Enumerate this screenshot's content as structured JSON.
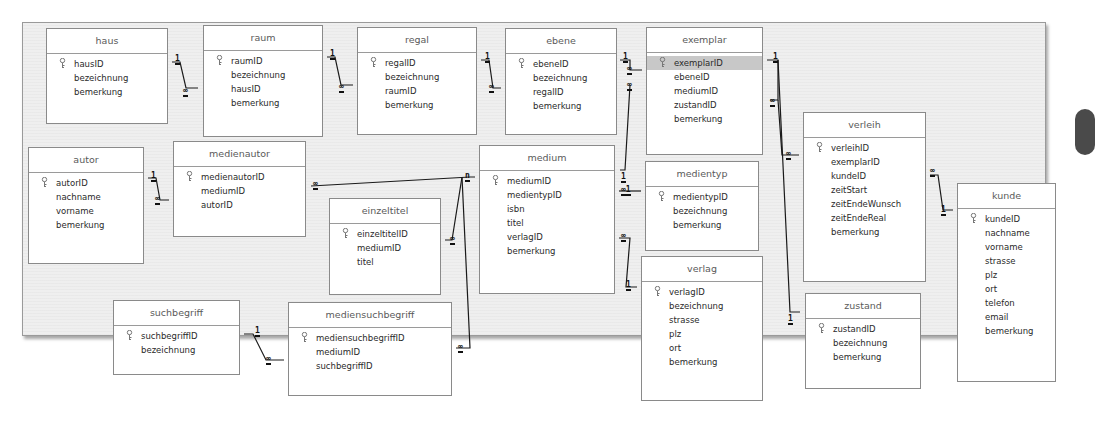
{
  "diagram": {
    "tables": [
      {
        "id": "haus",
        "name": "haus",
        "x": 46,
        "y": 28,
        "w": 122,
        "h": 96,
        "fields": [
          {
            "name": "hausID",
            "pk": true
          },
          {
            "name": "bezeichnung"
          },
          {
            "name": "bemerkung"
          }
        ]
      },
      {
        "id": "raum",
        "name": "raum",
        "x": 203,
        "y": 25,
        "w": 120,
        "h": 112,
        "fields": [
          {
            "name": "raumID",
            "pk": true
          },
          {
            "name": "bezeichnung"
          },
          {
            "name": "hausID"
          },
          {
            "name": "bemerkung"
          }
        ]
      },
      {
        "id": "regal",
        "name": "regal",
        "x": 357,
        "y": 27,
        "w": 120,
        "h": 108,
        "fields": [
          {
            "name": "regalID",
            "pk": true
          },
          {
            "name": "bezeichnung"
          },
          {
            "name": "raumID"
          },
          {
            "name": "bemerkung"
          }
        ]
      },
      {
        "id": "ebene",
        "name": "ebene",
        "x": 505,
        "y": 28,
        "w": 112,
        "h": 107,
        "fields": [
          {
            "name": "ebeneID",
            "pk": true
          },
          {
            "name": "bezeichnung"
          },
          {
            "name": "regalID"
          },
          {
            "name": "bemerkung"
          }
        ]
      },
      {
        "id": "exemplar",
        "name": "exemplar",
        "x": 646,
        "y": 27,
        "w": 117,
        "h": 128,
        "fields": [
          {
            "name": "exemplarID",
            "pk": true,
            "selected": true
          },
          {
            "name": "ebeneID"
          },
          {
            "name": "mediumID"
          },
          {
            "name": "zustandID"
          },
          {
            "name": "bemerkung"
          }
        ]
      },
      {
        "id": "autor",
        "name": "autor",
        "x": 28,
        "y": 147,
        "w": 116,
        "h": 117,
        "fields": [
          {
            "name": "autorID",
            "pk": true
          },
          {
            "name": "nachname"
          },
          {
            "name": "vorname"
          },
          {
            "name": "bemerkung"
          }
        ]
      },
      {
        "id": "medienautor",
        "name": "medienautor",
        "x": 173,
        "y": 141,
        "w": 133,
        "h": 96,
        "fields": [
          {
            "name": "medienautorID",
            "pk": true
          },
          {
            "name": "mediumID"
          },
          {
            "name": "autorID"
          }
        ]
      },
      {
        "id": "einzeltitel",
        "name": "einzeltitel",
        "x": 329,
        "y": 198,
        "w": 112,
        "h": 97,
        "fields": [
          {
            "name": "einzeltitelID",
            "pk": true
          },
          {
            "name": "mediumID"
          },
          {
            "name": "titel"
          }
        ]
      },
      {
        "id": "medium",
        "name": "medium",
        "x": 479,
        "y": 145,
        "w": 136,
        "h": 149,
        "fields": [
          {
            "name": "mediumID",
            "pk": true
          },
          {
            "name": "medientypID"
          },
          {
            "name": "isbn"
          },
          {
            "name": "titel"
          },
          {
            "name": "verlagID"
          },
          {
            "name": "bemerkung"
          }
        ]
      },
      {
        "id": "medientyp",
        "name": "medientyp",
        "x": 645,
        "y": 161,
        "w": 114,
        "h": 90,
        "fields": [
          {
            "name": "medientypID",
            "pk": true
          },
          {
            "name": "bezeichnung"
          },
          {
            "name": "bemerkung"
          }
        ]
      },
      {
        "id": "verlag",
        "name": "verlag",
        "x": 641,
        "y": 256,
        "w": 122,
        "h": 145,
        "fields": [
          {
            "name": "verlagID",
            "pk": true
          },
          {
            "name": "bezeichnung"
          },
          {
            "name": "strasse"
          },
          {
            "name": "plz"
          },
          {
            "name": "ort"
          },
          {
            "name": "bemerkung"
          }
        ]
      },
      {
        "id": "verleih",
        "name": "verleih",
        "x": 803,
        "y": 112,
        "w": 123,
        "h": 170,
        "fields": [
          {
            "name": "verleihID",
            "pk": true
          },
          {
            "name": "exemplarID"
          },
          {
            "name": "kundeID"
          },
          {
            "name": "zeitStart"
          },
          {
            "name": "zeitEndeWunsch"
          },
          {
            "name": "zeitEndeReal"
          },
          {
            "name": "bemerkung"
          }
        ]
      },
      {
        "id": "zustand",
        "name": "zustand",
        "x": 805,
        "y": 293,
        "w": 116,
        "h": 96,
        "fields": [
          {
            "name": "zustandID",
            "pk": true
          },
          {
            "name": "bezeichnung"
          },
          {
            "name": "bemerkung"
          }
        ]
      },
      {
        "id": "kunde",
        "name": "kunde",
        "x": 957,
        "y": 183,
        "w": 99,
        "h": 199,
        "fields": [
          {
            "name": "kundeID",
            "pk": true
          },
          {
            "name": "nachname"
          },
          {
            "name": "vorname"
          },
          {
            "name": "strasse"
          },
          {
            "name": "plz"
          },
          {
            "name": "ort"
          },
          {
            "name": "telefon"
          },
          {
            "name": "email"
          },
          {
            "name": "bemerkung"
          }
        ]
      },
      {
        "id": "suchbegriff",
        "name": "suchbegriff",
        "x": 113,
        "y": 300,
        "w": 127,
        "h": 75,
        "fields": [
          {
            "name": "suchbegriffID",
            "pk": true
          },
          {
            "name": "bezeichnung"
          }
        ]
      },
      {
        "id": "mediensuchbegriff",
        "name": "mediensuchbegriff",
        "x": 288,
        "y": 302,
        "w": 164,
        "h": 94,
        "fields": [
          {
            "name": "mediensuchbegriffID",
            "pk": true
          },
          {
            "name": "mediumID"
          },
          {
            "name": "suchbegriffID"
          }
        ]
      }
    ],
    "relationships": [
      {
        "from": "haus",
        "to": "raum",
        "from_card": "1",
        "to_card": "∞"
      },
      {
        "from": "raum",
        "to": "regal",
        "from_card": "1",
        "to_card": "∞"
      },
      {
        "from": "regal",
        "to": "ebene",
        "from_card": "1",
        "to_card": "∞"
      },
      {
        "from": "ebene",
        "to": "exemplar",
        "from_card": "1",
        "to_card": "∞"
      },
      {
        "from": "medium",
        "to": "exemplar",
        "from_card": "1",
        "to_card": "∞"
      },
      {
        "from": "exemplar",
        "to": "verleih",
        "from_card": "1",
        "to_card": "∞"
      },
      {
        "from": "zustand",
        "to": "exemplar",
        "from_card": "1",
        "to_card": "∞"
      },
      {
        "from": "kunde",
        "to": "verleih",
        "from_card": "1",
        "to_card": "∞"
      },
      {
        "from": "autor",
        "to": "medienautor",
        "from_card": "1",
        "to_card": "∞"
      },
      {
        "from": "medium",
        "to": "medienautor",
        "from_card": "n",
        "to_card": "∞"
      },
      {
        "from": "medium",
        "to": "einzeltitel",
        "from_card": "n",
        "to_card": "∞"
      },
      {
        "from": "medium",
        "to": "mediensuchbegriff",
        "from_card": "n",
        "to_card": "∞"
      },
      {
        "from": "medientyp",
        "to": "medium",
        "from_card": "1",
        "to_card": "∞"
      },
      {
        "from": "verlag",
        "to": "medium",
        "from_card": "1",
        "to_card": "∞"
      },
      {
        "from": "suchbegriff",
        "to": "mediensuchbegriff",
        "from_card": "1",
        "to_card": "∞"
      }
    ],
    "labels": [
      {
        "t": "1",
        "x": 175,
        "y": 55
      },
      {
        "t": "∞",
        "x": 183,
        "y": 87
      },
      {
        "t": "1",
        "x": 330,
        "y": 50
      },
      {
        "t": "∞",
        "x": 339,
        "y": 83
      },
      {
        "t": "1",
        "x": 485,
        "y": 53
      },
      {
        "t": "∞",
        "x": 489,
        "y": 83
      },
      {
        "t": "1",
        "x": 623,
        "y": 53
      },
      {
        "t": "∞",
        "x": 627,
        "y": 65
      },
      {
        "t": "∞",
        "x": 627,
        "y": 81
      },
      {
        "t": "1",
        "x": 773,
        "y": 53
      },
      {
        "t": "∞",
        "x": 770,
        "y": 97
      },
      {
        "t": "∞",
        "x": 786,
        "y": 150
      },
      {
        "t": "1",
        "x": 788,
        "y": 315
      },
      {
        "t": "∞",
        "x": 930,
        "y": 167
      },
      {
        "t": "1",
        "x": 941,
        "y": 206
      },
      {
        "t": "1",
        "x": 151,
        "y": 172
      },
      {
        "t": "∞",
        "x": 155,
        "y": 195
      },
      {
        "t": "∞",
        "x": 313,
        "y": 180
      },
      {
        "t": "n",
        "x": 465,
        "y": 172
      },
      {
        "t": "∞",
        "x": 450,
        "y": 235
      },
      {
        "t": "1",
        "x": 621,
        "y": 173
      },
      {
        "t": "∞1",
        "x": 621,
        "y": 186
      },
      {
        "t": "∞",
        "x": 621,
        "y": 232
      },
      {
        "t": "1",
        "x": 626,
        "y": 281
      },
      {
        "t": "1",
        "x": 255,
        "y": 327
      },
      {
        "t": "∞",
        "x": 266,
        "y": 355
      },
      {
        "t": "∞",
        "x": 458,
        "y": 343
      }
    ]
  }
}
